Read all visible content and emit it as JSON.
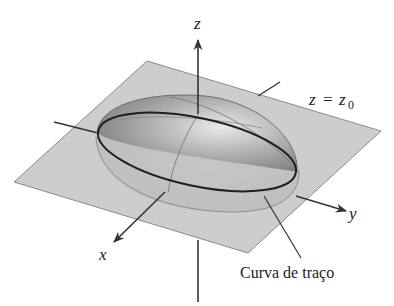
{
  "figure": {
    "type": "3d-surface-diagram",
    "axes": {
      "z_label": "z",
      "y_label": "y",
      "x_label": "x"
    },
    "plane_label": {
      "var": "z",
      "eq": "=",
      "rhs": "z",
      "sub": "0"
    },
    "trace_label": "Curva de traço",
    "colors": {
      "plane_fill": "#c4c4c4",
      "plane_edge": "#8a8a8a",
      "ellipsoid_fill": "#9a9a9a",
      "ellipsoid_highlight": "#e6e6e6",
      "trace_curve": "#1e1e1e",
      "axis": "#333333"
    }
  }
}
